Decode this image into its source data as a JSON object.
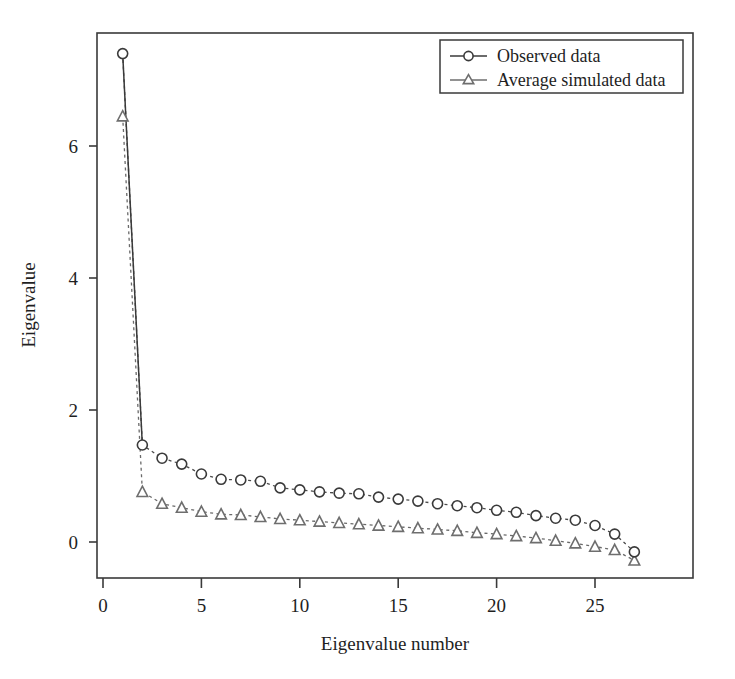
{
  "chart_data": {
    "type": "line",
    "title": "",
    "subtitle": "",
    "xlabel": "Eigenvalue number",
    "ylabel": "Eigenvalue",
    "xlim": [
      -0.4,
      30.0
    ],
    "ylim": [
      -0.55,
      8.05
    ],
    "xticks": [
      0,
      5,
      10,
      15,
      20,
      25
    ],
    "xticklabels": [
      "0",
      "5",
      "10",
      "15",
      "20",
      "25"
    ],
    "yticks": [
      0,
      2,
      4,
      6
    ],
    "yticklabels": [
      "0",
      "2",
      "4",
      "6"
    ],
    "grid": false,
    "legend_position": "top-right",
    "x": [
      1,
      2,
      3,
      4,
      5,
      6,
      7,
      8,
      9,
      10,
      11,
      12,
      13,
      14,
      15,
      16,
      17,
      18,
      19,
      20,
      21,
      22,
      23,
      24,
      25,
      26,
      27
    ],
    "series": [
      {
        "name": "Observed data",
        "marker": "circle",
        "linestyle": "dotted",
        "color": "#3a3a3a",
        "values": [
          7.4,
          1.47,
          1.27,
          1.18,
          1.03,
          0.95,
          0.94,
          0.92,
          0.82,
          0.79,
          0.76,
          0.74,
          0.73,
          0.68,
          0.65,
          0.62,
          0.58,
          0.55,
          0.52,
          0.48,
          0.45,
          0.4,
          0.36,
          0.33,
          0.25,
          0.12,
          -0.15
        ]
      },
      {
        "name": "Average simulated data",
        "marker": "triangle",
        "linestyle": "dotted",
        "color": "#6e6e6e",
        "values": [
          6.45,
          0.76,
          0.58,
          0.52,
          0.46,
          0.42,
          0.41,
          0.38,
          0.35,
          0.33,
          0.31,
          0.29,
          0.27,
          0.25,
          0.23,
          0.21,
          0.19,
          0.17,
          0.14,
          0.12,
          0.09,
          0.06,
          0.02,
          -0.02,
          -0.07,
          -0.12,
          -0.28
        ]
      }
    ]
  },
  "legend": {
    "entries": [
      {
        "label": "Observed data",
        "marker": "circle-icon"
      },
      {
        "label": "Average simulated data",
        "marker": "triangle-icon"
      }
    ]
  },
  "axes": {
    "x_title": "Eigenvalue number",
    "y_title": "Eigenvalue"
  }
}
